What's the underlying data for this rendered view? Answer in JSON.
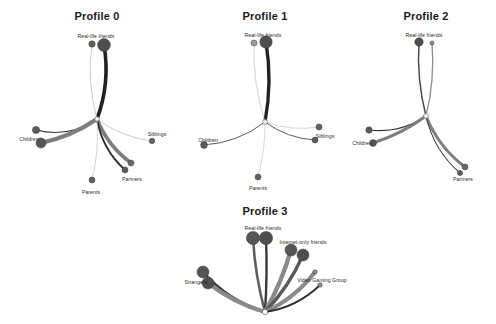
{
  "figure": {
    "width": 496,
    "height": 324,
    "background": "#ffffff"
  },
  "style": {
    "node_fill": "#5a5a5a",
    "node_stroke": "#3d3d3d",
    "hub_fill": "#ffffff",
    "hub_stroke": "#7a7a7a",
    "edge_dark": "#2b2b2b",
    "edge_mid": "#6f6f6f",
    "edge_light": "#a8a8a8",
    "edge_faint": "#c9c9c9",
    "title_color": "#1a1a1a",
    "label_color": "#2b2b2b"
  },
  "chart_data": {
    "type": "diagram",
    "subtype": "radial-hub-and-spoke node-link graphs",
    "panels": [
      {
        "id": "profile-0",
        "title": "Profile 0",
        "hub": {
          "x": 97,
          "y": 119,
          "r": 2.2
        },
        "labels": [
          {
            "text": "Real-life friends",
            "x": 96,
            "y": 33,
            "size": "small"
          },
          {
            "text": "Children",
            "x": 29,
            "y": 136,
            "size": "small"
          },
          {
            "text": "Siblings",
            "x": 157,
            "y": 131,
            "size": "small"
          },
          {
            "text": "Partners",
            "x": 132,
            "y": 176,
            "size": "small"
          },
          {
            "text": "Parents",
            "x": 91,
            "y": 189,
            "size": "small"
          }
        ],
        "nodes": [
          {
            "name": "real-life-friends-a",
            "x": 92,
            "y": 44,
            "r": 3.2,
            "shade": "#5f5f5f"
          },
          {
            "name": "real-life-friends-b",
            "x": 104,
            "y": 45,
            "r": 6.4,
            "shade": "#4e4e4e"
          },
          {
            "name": "children-a",
            "x": 36,
            "y": 130,
            "r": 3.6,
            "shade": "#5a5a5a"
          },
          {
            "name": "children-b",
            "x": 41,
            "y": 143,
            "r": 5.0,
            "shade": "#545454"
          },
          {
            "name": "siblings-a",
            "x": 152,
            "y": 141,
            "r": 2.8,
            "shade": "#636363"
          },
          {
            "name": "partners-a",
            "x": 131,
            "y": 163,
            "r": 3.0,
            "shade": "#6a6a6a"
          },
          {
            "name": "partners-b",
            "x": 125,
            "y": 170,
            "r": 3.0,
            "shade": "#5a5a5a"
          },
          {
            "name": "parents-a",
            "x": 92,
            "y": 180,
            "r": 3.0,
            "shade": "#5f5f5f"
          }
        ],
        "edges": [
          {
            "from": "hub",
            "to": "real-life-friends-b",
            "width": 3.6,
            "color": "#222222",
            "curve": 10
          },
          {
            "from": "hub",
            "to": "real-life-friends-a",
            "width": 0.7,
            "color": "#b5b5b5",
            "curve": -8
          },
          {
            "from": "hub",
            "to": "children-a",
            "width": 1.2,
            "color": "#3a3a3a",
            "curve": -14
          },
          {
            "from": "hub",
            "to": "children-b",
            "width": 4.2,
            "color": "#7d7d7d",
            "curve": -6
          },
          {
            "from": "hub",
            "to": "siblings-a",
            "width": 0.7,
            "color": "#b5b5b5",
            "curve": 8
          },
          {
            "from": "hub",
            "to": "partners-a",
            "width": 3.6,
            "color": "#7d7d7d",
            "curve": 8
          },
          {
            "from": "hub",
            "to": "partners-b",
            "width": 1.8,
            "color": "#2f2f2f",
            "curve": 10
          },
          {
            "from": "hub",
            "to": "parents-a",
            "width": 0.7,
            "color": "#c0c0c0",
            "curve": -5
          }
        ]
      },
      {
        "id": "profile-1",
        "title": "Profile 1",
        "hub": {
          "x": 265,
          "y": 122,
          "r": 2.4
        },
        "labels": [
          {
            "text": "Real-life friends",
            "x": 263,
            "y": 32,
            "size": "small"
          },
          {
            "text": "Children",
            "x": 208,
            "y": 137,
            "size": "small"
          },
          {
            "text": "Siblings",
            "x": 325,
            "y": 133,
            "size": "small"
          },
          {
            "text": "Parents",
            "x": 258,
            "y": 185,
            "size": "small"
          }
        ],
        "nodes": [
          {
            "name": "real-life-friends-a",
            "x": 254,
            "y": 43,
            "r": 3.0,
            "shade": "#9a9a9a"
          },
          {
            "name": "real-life-friends-b",
            "x": 266,
            "y": 42,
            "r": 6.2,
            "shade": "#4e4e4e"
          },
          {
            "name": "children-a",
            "x": 204,
            "y": 145,
            "r": 3.4,
            "shade": "#5a5a5a"
          },
          {
            "name": "siblings-a",
            "x": 319,
            "y": 127,
            "r": 3.0,
            "shade": "#5f5f5f"
          },
          {
            "name": "siblings-b",
            "x": 315,
            "y": 140,
            "r": 3.0,
            "shade": "#5a5a5a"
          },
          {
            "name": "parents-a",
            "x": 258,
            "y": 177,
            "r": 3.0,
            "shade": "#5f5f5f"
          }
        ],
        "edges": [
          {
            "from": "hub",
            "to": "real-life-friends-b",
            "width": 3.4,
            "color": "#222222",
            "curve": 7
          },
          {
            "from": "hub",
            "to": "real-life-friends-a",
            "width": 0.7,
            "color": "#bfbfbf",
            "curve": -7
          },
          {
            "from": "hub",
            "to": "children-a",
            "width": 0.9,
            "color": "#4a4a4a",
            "curve": -10
          },
          {
            "from": "hub",
            "to": "siblings-a",
            "width": 0.7,
            "color": "#c4c4c4",
            "curve": 7
          },
          {
            "from": "hub",
            "to": "siblings-b",
            "width": 0.9,
            "color": "#4a4a4a",
            "curve": 8
          },
          {
            "from": "hub",
            "to": "parents-a",
            "width": 0.7,
            "color": "#c4c4c4",
            "curve": -4
          }
        ]
      },
      {
        "id": "profile-2",
        "title": "Profile 2",
        "hub": {
          "x": 426,
          "y": 116,
          "r": 2.4
        },
        "labels": [
          {
            "text": "Real-life friends",
            "x": 424,
            "y": 32,
            "size": "small"
          },
          {
            "text": "Children",
            "x": 362,
            "y": 140,
            "size": "small"
          },
          {
            "text": "Partners",
            "x": 463,
            "y": 176,
            "size": "small"
          }
        ],
        "nodes": [
          {
            "name": "real-life-friends-a",
            "x": 419,
            "y": 42,
            "r": 4.2,
            "shade": "#4e4e4e"
          },
          {
            "name": "real-life-friends-b",
            "x": 432,
            "y": 43,
            "r": 2.0,
            "shade": "#8a8a8a"
          },
          {
            "name": "children-a",
            "x": 369,
            "y": 130,
            "r": 3.2,
            "shade": "#5a5a5a"
          },
          {
            "name": "children-b",
            "x": 373,
            "y": 143,
            "r": 3.4,
            "shade": "#545454"
          },
          {
            "name": "partners-a",
            "x": 465,
            "y": 167,
            "r": 3.0,
            "shade": "#6a6a6a"
          },
          {
            "name": "partners-b",
            "x": 460,
            "y": 173,
            "r": 2.6,
            "shade": "#5a5a5a"
          }
        ],
        "edges": [
          {
            "from": "hub",
            "to": "real-life-friends-a",
            "width": 1.5,
            "color": "#4a4a4a",
            "curve": -6
          },
          {
            "from": "hub",
            "to": "real-life-friends-b",
            "width": 1.3,
            "color": "#8d8d8d",
            "curve": 6
          },
          {
            "from": "hub",
            "to": "children-a",
            "width": 1.1,
            "color": "#3a3a3a",
            "curve": -11
          },
          {
            "from": "hub",
            "to": "children-b",
            "width": 3.0,
            "color": "#7d7d7d",
            "curve": -5
          },
          {
            "from": "hub",
            "to": "partners-a",
            "width": 3.0,
            "color": "#7d7d7d",
            "curve": 9
          },
          {
            "from": "hub",
            "to": "partners-b",
            "width": 1.1,
            "color": "#3a3a3a",
            "curve": 11
          }
        ]
      },
      {
        "id": "profile-3",
        "title": "Profile 3",
        "hub": {
          "x": 265,
          "y": 312,
          "r": 2.6
        },
        "labels": [
          {
            "text": "Real-life friends",
            "x": 263,
            "y": 225,
            "size": "small"
          },
          {
            "text": "Internet-only friends",
            "x": 303,
            "y": 239,
            "size": "small"
          },
          {
            "text": "Strangers",
            "x": 196,
            "y": 279,
            "size": "small"
          },
          {
            "text": "Video Gaming Group",
            "x": 322,
            "y": 277,
            "size": "small"
          }
        ],
        "nodes": [
          {
            "name": "real-life-friends-a",
            "x": 253,
            "y": 238,
            "r": 6.6,
            "shade": "#565656"
          },
          {
            "name": "real-life-friends-b",
            "x": 266,
            "y": 238,
            "r": 6.6,
            "shade": "#4e4e4e"
          },
          {
            "name": "internet-only-friends-a",
            "x": 291,
            "y": 250,
            "r": 6.0,
            "shade": "#565656"
          },
          {
            "name": "internet-only-friends-b",
            "x": 303,
            "y": 255,
            "r": 6.0,
            "shade": "#4e4e4e"
          },
          {
            "name": "strangers-a",
            "x": 203,
            "y": 272,
            "r": 6.0,
            "shade": "#565656"
          },
          {
            "name": "strangers-b",
            "x": 208,
            "y": 283,
            "r": 6.0,
            "shade": "#4e4e4e"
          },
          {
            "name": "video-gaming-group-a",
            "x": 315,
            "y": 272,
            "r": 2.2,
            "shade": "#8a8a8a"
          },
          {
            "name": "video-gaming-group-b",
            "x": 320,
            "y": 285,
            "r": 2.2,
            "shade": "#8a8a8a"
          }
        ],
        "edges": [
          {
            "from": "hub",
            "to": "real-life-friends-a",
            "width": 2.6,
            "color": "#5f5f5f",
            "curve": -4
          },
          {
            "from": "hub",
            "to": "real-life-friends-b",
            "width": 2.4,
            "color": "#3a3a3a",
            "curve": 2
          },
          {
            "from": "hub",
            "to": "internet-only-friends-a",
            "width": 4.4,
            "color": "#8a8a8a",
            "curve": 4
          },
          {
            "from": "hub",
            "to": "internet-only-friends-b",
            "width": 3.4,
            "color": "#5a5a5a",
            "curve": 6
          },
          {
            "from": "hub",
            "to": "strangers-a",
            "width": 2.2,
            "color": "#2f2f2f",
            "curve": -10
          },
          {
            "from": "hub",
            "to": "strangers-b",
            "width": 4.4,
            "color": "#8a8a8a",
            "curve": -6
          },
          {
            "from": "hub",
            "to": "video-gaming-group-a",
            "width": 4.0,
            "color": "#8a8a8a",
            "curve": 8
          },
          {
            "from": "hub",
            "to": "video-gaming-group-b",
            "width": 1.8,
            "color": "#2f2f2f",
            "curve": 10
          }
        ]
      }
    ]
  }
}
